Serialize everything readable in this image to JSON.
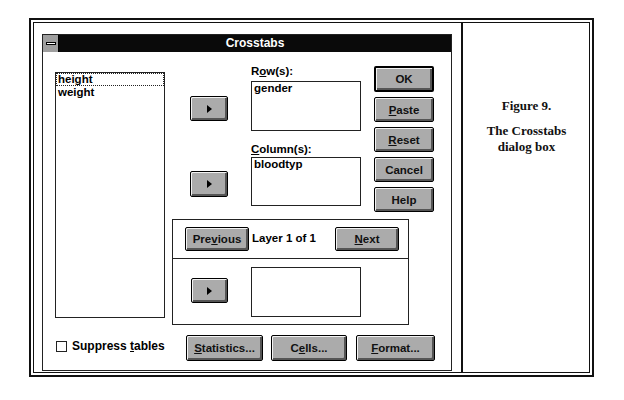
{
  "dialog": {
    "title": "Crosstabs",
    "system_menu_icon": "system-menu-icon"
  },
  "variable_list": {
    "items": [
      {
        "label": "height",
        "focused": true
      },
      {
        "label": "weight",
        "focused": false
      }
    ]
  },
  "rows": {
    "label_prefix": "R",
    "label_mnemonic": "o",
    "label_suffix": "w(s):",
    "items": [
      "gender"
    ]
  },
  "columns": {
    "label_mnemonic": "C",
    "label_suffix": "olumn(s):",
    "items": [
      "bloodtyp"
    ]
  },
  "transfer_buttons": {
    "icon": "right-arrow-icon"
  },
  "buttons": {
    "ok": "OK",
    "paste_mnemonic": "P",
    "paste_rest": "aste",
    "reset_mnemonic": "R",
    "reset_rest": "eset",
    "cancel": "Cancel",
    "help": "Help"
  },
  "layer": {
    "previous_prefix": "Pre",
    "previous_mnemonic": "v",
    "previous_suffix": "ious",
    "status": "Layer 1 of 1",
    "next_mnemonic": "N",
    "next_rest": "ext",
    "items": []
  },
  "footer": {
    "suppress_prefix": "Suppress ",
    "suppress_mnemonic": "t",
    "suppress_suffix": "ables",
    "suppress_checked": false,
    "statistics_mnemonic": "S",
    "statistics_rest": "tatistics...",
    "cells_prefix": "C",
    "cells_mnemonic": "e",
    "cells_suffix": "lls...",
    "format_mnemonic": "F",
    "format_rest": "ormat..."
  },
  "caption": {
    "figure": "Figure 9.",
    "line1": "The Crosstabs",
    "line2": "dialog box"
  }
}
